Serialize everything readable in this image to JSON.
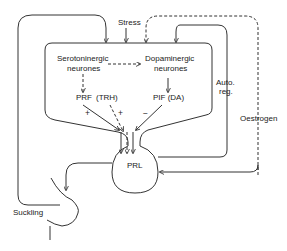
{
  "diagram": {
    "type": "physiological control diagram",
    "nodes": {
      "stress": "Stress",
      "serotonergic_line1": "Serotoninergic",
      "serotonergic_line2": "neurones",
      "dopaminergic_line1": "Dopaminergic",
      "dopaminergic_line2": "neurones",
      "prf": "PRF",
      "trh": "(TRH)",
      "pif": "PIF (DA)",
      "prl": "PRL",
      "auto_reg_line1": "Auto.",
      "auto_reg_line2": "reg.",
      "oestrogen": "Oestrogen",
      "suckling": "Suckling"
    },
    "signs": {
      "prf_sign": "+",
      "trh_sign": "+",
      "pif_sign": "−"
    },
    "edges": [
      {
        "from": "Stress",
        "to": "hypothalamus",
        "style": "solid"
      },
      {
        "from": "Serotoninergic neurones",
        "to": "Dopaminergic neurones",
        "style": "dashed"
      },
      {
        "from": "Serotoninergic neurones",
        "to": "PRF",
        "style": "dashed"
      },
      {
        "from": "Dopaminergic neurones",
        "to": "PIF (DA)",
        "style": "solid"
      },
      {
        "from": "PRF",
        "to": "PRL",
        "sign": "+"
      },
      {
        "from": "(TRH)",
        "to": "PRL",
        "sign": "+"
      },
      {
        "from": "PIF (DA)",
        "to": "PRL",
        "sign": "−"
      },
      {
        "from": "PRL",
        "to": "hypothalamus",
        "label": "Auto. reg.",
        "style": "solid"
      },
      {
        "from": "Oestrogen",
        "to": "hypothalamus",
        "style": "dashed"
      },
      {
        "from": "Oestrogen",
        "to": "PRL",
        "style": "solid"
      },
      {
        "from": "Suckling",
        "to": "hypothalamus",
        "style": "solid"
      },
      {
        "from": "PRL",
        "to": "breast",
        "style": "solid"
      }
    ]
  }
}
